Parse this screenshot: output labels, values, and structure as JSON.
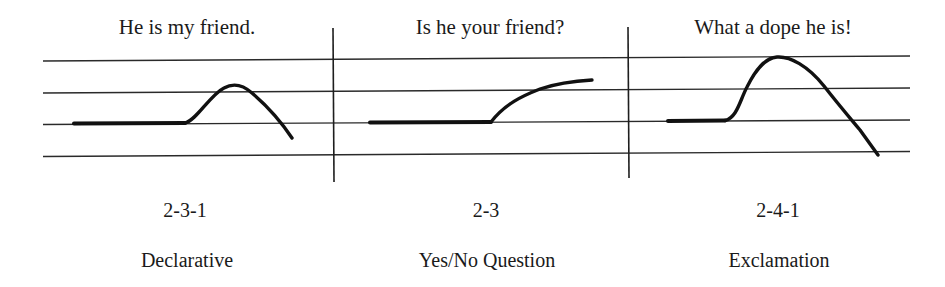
{
  "figure": {
    "panels": [
      {
        "sentence": "He is my friend.",
        "pattern": "2-3-1",
        "type": "Declarative",
        "center_x": 187,
        "contour": {
          "flat": [
            [
              74,
              123.5
            ],
            [
              185,
              123
            ]
          ],
          "curve": "M185,123 C196,121 210,95 224,88 C233,83 243,85 252,93 C266,105 280,120 292,138"
        }
      },
      {
        "sentence": "Is he your friend?",
        "pattern": "2-3",
        "type": "Yes/No Question",
        "center_x": 487,
        "contour": {
          "flat": [
            [
              370,
              122.5
            ],
            [
              491,
              122
            ]
          ],
          "curve": "M491,122 C505,104 522,96 540,89 C558,83 575,81 592,80"
        }
      },
      {
        "sentence": "What a dope he is!",
        "pattern": "2-4-1",
        "type": "Exclamation",
        "center_x": 775,
        "contour": {
          "flat": [
            [
              668,
              121
            ],
            [
              725,
              120.5
            ]
          ],
          "curve": "M725,120.5 C737,118 740,100 747,87 C756,69 765,58 777,57 C790,56 808,66 824,86 C838,104 850,118 860,130 C868,141 873,148 878,155"
        }
      }
    ],
    "staff_lines": [
      {
        "x1": 43,
        "y1": 61,
        "x2": 910,
        "y2": 56
      },
      {
        "x1": 43,
        "y1": 93,
        "x2": 910,
        "y2": 88
      },
      {
        "x1": 43,
        "y1": 124.5,
        "x2": 910,
        "y2": 120
      },
      {
        "x1": 43,
        "y1": 156.5,
        "x2": 910,
        "y2": 151.5
      }
    ],
    "dividers": [
      {
        "x1": 333,
        "y1": 28,
        "x2": 334,
        "y2": 182
      },
      {
        "x1": 628,
        "y1": 27,
        "x2": 629,
        "y2": 178
      }
    ],
    "colors": {
      "ink": "#111111",
      "background": "#ffffff"
    }
  }
}
